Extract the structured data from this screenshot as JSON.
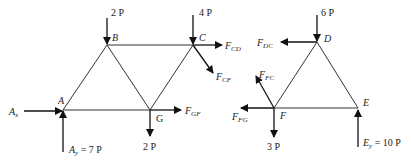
{
  "diagram": {
    "type": "truss free-body diagrams",
    "left_section": {
      "nodes": {
        "A": {
          "label": "A",
          "x": 63,
          "y": 110
        },
        "B": {
          "label": "B",
          "x": 107,
          "y": 45
        },
        "C": {
          "label": "C",
          "x": 193,
          "y": 45
        },
        "G": {
          "label": "G",
          "x": 150,
          "y": 110
        }
      },
      "loads": {
        "B_load": "2 P",
        "C_load": "4 P",
        "G_load": "2 P",
        "Ax": "A",
        "Ax_sub": "x",
        "Ay": "A",
        "Ay_sub": "y",
        "Ay_value": " = 7 P",
        "FCD": "F",
        "FCD_sub": "CD",
        "FCF": "F",
        "FCF_sub": "CF",
        "FGF": "F",
        "FGF_sub": "GF"
      }
    },
    "right_section": {
      "nodes": {
        "D": {
          "label": "D",
          "x": 317,
          "y": 42
        },
        "E": {
          "label": "E",
          "x": 358,
          "y": 108
        },
        "F": {
          "label": "F",
          "x": 274,
          "y": 108
        }
      },
      "loads": {
        "D_load": "6 P",
        "F_load": "3 P",
        "FDC": "F",
        "FDC_sub": "DC",
        "FFC": "F",
        "FFC_sub": "FC",
        "FFG": "F",
        "FFG_sub": "FG",
        "Ey": "E",
        "Ey_sub": "y",
        "Ey_value": " = 10  P"
      }
    },
    "colors": {
      "line": "#333333",
      "arrow": "#111111",
      "text": "#222222"
    }
  }
}
